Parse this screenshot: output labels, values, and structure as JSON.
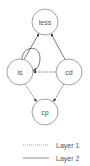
{
  "diagram": {
    "type": "directed-graph",
    "colors": {
      "node_stroke": "#8a8a8a",
      "edge": "#555555",
      "text": "#555555",
      "background": "#ffffff"
    },
    "nodes": [
      {
        "id": "less",
        "label": "less",
        "cx": 45,
        "cy": 22,
        "r": 13
      },
      {
        "id": "ls",
        "label": "ls",
        "cx": 20,
        "cy": 72,
        "r": 13
      },
      {
        "id": "cd",
        "label": "cd",
        "cx": 69,
        "cy": 72,
        "r": 13
      },
      {
        "id": "cp",
        "label": "cp",
        "cx": 45,
        "cy": 112,
        "r": 13
      }
    ],
    "edges": [
      {
        "from": "ls",
        "to": "less",
        "layer": "Layer 2",
        "style": "solid"
      },
      {
        "from": "cd",
        "to": "less",
        "layer": "Layer 2",
        "style": "solid"
      },
      {
        "from": "ls",
        "to": "ls",
        "layer": "Layer 2",
        "style": "solid",
        "self_loop": true
      },
      {
        "from": "cd",
        "to": "ls",
        "layer": "Layer 1",
        "style": "dotted"
      },
      {
        "from": "ls",
        "to": "cp",
        "layer": "Layer 1",
        "style": "dotted"
      },
      {
        "from": "cd",
        "to": "cp",
        "layer": "Layer 1",
        "style": "dotted"
      }
    ]
  },
  "legend": {
    "items": [
      {
        "label": "Layer 1",
        "style": "dotted"
      },
      {
        "label": "Layer 2",
        "style": "solid"
      }
    ]
  }
}
